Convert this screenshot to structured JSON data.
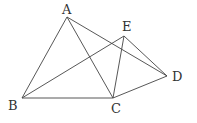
{
  "diagram": {
    "type": "geometry",
    "points": {
      "A": {
        "label": "A",
        "x": 67,
        "y": 17,
        "lx": 62,
        "ly": 14
      },
      "B": {
        "label": "B",
        "x": 22,
        "y": 98,
        "lx": 8,
        "ly": 110
      },
      "C": {
        "label": "C",
        "x": 113,
        "y": 98,
        "lx": 111,
        "ly": 113
      },
      "D": {
        "label": "D",
        "x": 167,
        "y": 76,
        "lx": 172,
        "ly": 81
      },
      "E": {
        "label": "E",
        "x": 124,
        "y": 36,
        "lx": 122,
        "ly": 31
      }
    },
    "segments": [
      [
        "A",
        "B"
      ],
      [
        "A",
        "C"
      ],
      [
        "A",
        "D"
      ],
      [
        "B",
        "C"
      ],
      [
        "B",
        "E"
      ],
      [
        "E",
        "C"
      ],
      [
        "E",
        "D"
      ],
      [
        "C",
        "D"
      ]
    ],
    "colors": {
      "stroke": "#444444",
      "label": "#333333",
      "background": "#ffffff"
    }
  }
}
